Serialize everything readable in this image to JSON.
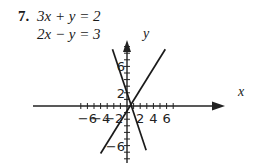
{
  "problem": {
    "number": "7.",
    "equations": [
      "3x + y = 2",
      "2x − y = 3"
    ]
  },
  "chart_data": {
    "type": "line",
    "title": "",
    "xlabel": "x",
    "ylabel": "y",
    "xticks": [
      -6,
      -4,
      -2,
      2,
      4,
      6
    ],
    "yticks": [
      6,
      2,
      -6
    ],
    "xlim": [
      -7.5,
      7.5
    ],
    "ylim": [
      -8,
      9.5
    ],
    "grid": false,
    "series": [
      {
        "name": "3x + y = 2",
        "equation": "y = 2 - 3x",
        "x": [
          -2.2,
          2.9
        ],
        "y": [
          8.6,
          -6.7
        ]
      },
      {
        "name": "2x - y = 3",
        "equation": "y = 2x - 3",
        "x": [
          -4,
          5.8
        ],
        "y": [
          -7.2,
          8.6
        ]
      }
    ],
    "solution": {
      "x": 1,
      "y": -1
    }
  }
}
